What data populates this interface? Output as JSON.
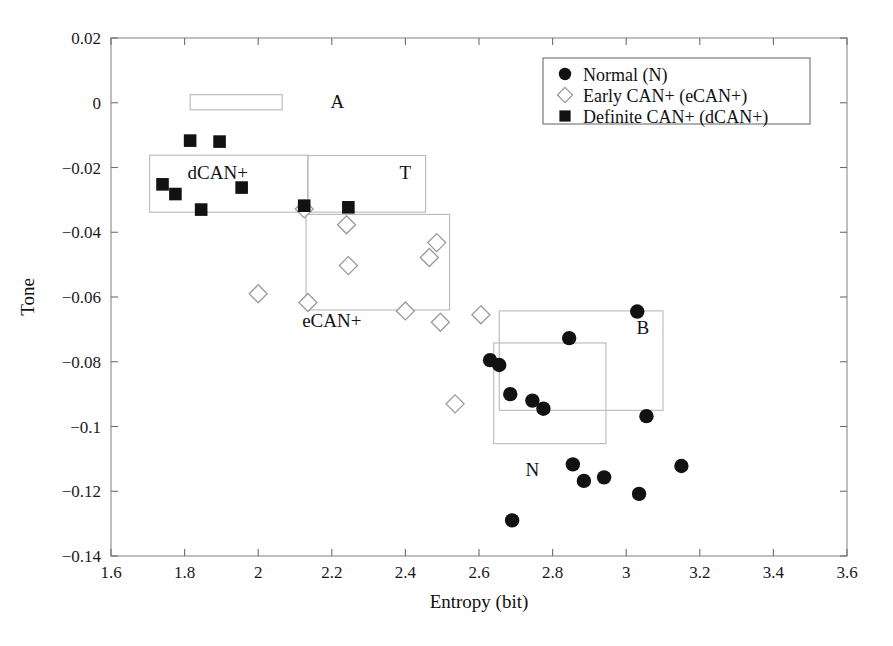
{
  "chart_data": {
    "type": "scatter",
    "title": "",
    "xlabel": "Entropy (bit)",
    "ylabel": "Tone",
    "xlim": [
      1.6,
      3.6
    ],
    "ylim": [
      -0.14,
      0.02
    ],
    "xticks": [
      "1.6",
      "1.8",
      "2",
      "2.2",
      "2.4",
      "2.6",
      "2.8",
      "3",
      "3.2",
      "3.4",
      "3.6"
    ],
    "xtick_values": [
      1.6,
      1.8,
      2.0,
      2.2,
      2.4,
      2.6,
      2.8,
      3.0,
      3.2,
      3.4,
      3.6
    ],
    "yticks": [
      "0.02",
      "0",
      "−0.02",
      "−0.04",
      "−0.06",
      "−0.08",
      "−0.1",
      "−0.12",
      "−0.14"
    ],
    "ytick_values": [
      0.02,
      0,
      -0.02,
      -0.04,
      -0.06,
      -0.08,
      -0.1,
      -0.12,
      -0.14
    ],
    "grid": false,
    "legend_position": "top-right",
    "series": [
      {
        "name": "Normal (N)",
        "marker": "filled-circle",
        "color": "#121212",
        "points": [
          [
            2.63,
            -0.0795
          ],
          [
            2.655,
            -0.081
          ],
          [
            2.685,
            -0.09
          ],
          [
            2.745,
            -0.092
          ],
          [
            2.775,
            -0.0945
          ],
          [
            2.845,
            -0.0727
          ],
          [
            2.855,
            -0.1117
          ],
          [
            2.885,
            -0.1168
          ],
          [
            2.94,
            -0.1157
          ],
          [
            3.03,
            -0.0645
          ],
          [
            3.035,
            -0.1208
          ],
          [
            3.055,
            -0.0968
          ],
          [
            3.15,
            -0.1122
          ],
          [
            2.69,
            -0.129
          ]
        ]
      },
      {
        "name": "Early CAN+ (eCAN+)",
        "marker": "open-diamond",
        "color": "#9a9a9a",
        "points": [
          [
            2.0,
            -0.059
          ],
          [
            2.125,
            -0.0328
          ],
          [
            2.135,
            -0.0617
          ],
          [
            2.24,
            -0.0377
          ],
          [
            2.245,
            -0.0503
          ],
          [
            2.4,
            -0.0643
          ],
          [
            2.465,
            -0.0478
          ],
          [
            2.485,
            -0.0432
          ],
          [
            2.495,
            -0.0678
          ],
          [
            2.535,
            -0.093
          ],
          [
            2.605,
            -0.0655
          ]
        ]
      },
      {
        "name": "Definite CAN+ (dCAN+)",
        "marker": "filled-square",
        "color": "#121212",
        "points": [
          [
            1.74,
            -0.0252
          ],
          [
            1.775,
            -0.0282
          ],
          [
            1.815,
            -0.0117
          ],
          [
            1.845,
            -0.033
          ],
          [
            1.895,
            -0.012
          ],
          [
            1.955,
            -0.0262
          ],
          [
            2.125,
            -0.0318
          ],
          [
            2.245,
            -0.0323
          ]
        ]
      }
    ],
    "annotations": [
      {
        "label": "A",
        "label_x": 2.215,
        "label_y": 0.0005,
        "box": {
          "x0": 1.815,
          "y0": 0.0025,
          "x1": 2.065,
          "y1": -0.0022
        }
      },
      {
        "label": "dCAN+",
        "label_x": 1.89,
        "label_y": -0.0215,
        "box": {
          "x0": 1.705,
          "y0": -0.0162,
          "x1": 2.135,
          "y1": -0.0338
        }
      },
      {
        "label": "T",
        "label_x": 2.4,
        "label_y": -0.0213,
        "box": {
          "x0": 2.135,
          "y0": -0.0163,
          "x1": 2.455,
          "y1": -0.0338
        }
      },
      {
        "label": "eCAN+",
        "label_x": 2.2,
        "label_y": -0.067,
        "box": {
          "x0": 2.13,
          "y0": -0.0345,
          "x1": 2.52,
          "y1": -0.064
        }
      },
      {
        "label": "B",
        "label_x": 3.045,
        "label_y": -0.0693,
        "box": {
          "x0": 2.655,
          "y0": -0.0643,
          "x1": 3.1,
          "y1": -0.095
        }
      },
      {
        "label": "N",
        "label_x": 2.745,
        "label_y": -0.1131,
        "box": {
          "x0": 2.64,
          "y0": -0.0742,
          "x1": 2.945,
          "y1": -0.1053
        }
      }
    ]
  },
  "legend": {
    "entries": [
      {
        "label": "Normal (N)",
        "marker": "filled-circle"
      },
      {
        "label": "Early CAN+ (eCAN+)",
        "marker": "open-diamond"
      },
      {
        "label": "Definite CAN+ (dCAN+)",
        "marker": "filled-square"
      }
    ]
  },
  "colors": {
    "marker_dark": "#121212",
    "marker_open_stroke": "#9a9a9a",
    "axis": "#8a8a8a",
    "region_box": "#b9b9b9",
    "text": "#111111"
  }
}
